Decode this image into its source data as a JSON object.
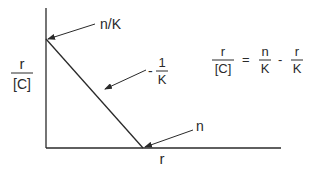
{
  "diagram": {
    "type": "scatchard-plot",
    "axes": {
      "x_label": "r",
      "y_label_numerator": "r",
      "y_label_denominator": "[C]"
    },
    "annotations": {
      "y_intercept": "n/K",
      "slope_sign": "-",
      "slope_numerator": "1",
      "slope_denominator": "K",
      "x_intercept": "n"
    },
    "equation": {
      "lhs_numerator": "r",
      "lhs_denominator": "[C]",
      "equals": "=",
      "term1_numerator": "n",
      "term1_denominator": "K",
      "minus": "-",
      "term2_numerator": "r",
      "term2_denominator": "K"
    },
    "colors": {
      "ink": "#2a2a2a",
      "background": "#ffffff"
    }
  }
}
